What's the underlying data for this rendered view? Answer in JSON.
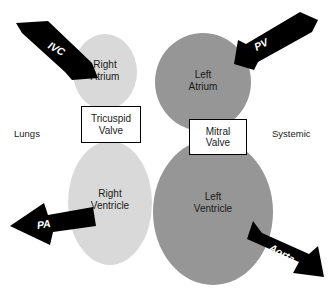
{
  "diagram": {
    "background_color": "#ffffff",
    "colors": {
      "right_side_fill": "#d9d9d9",
      "left_side_fill": "#969696",
      "arrow_fill": "#000000",
      "valve_box_fill": "#ffffff",
      "valve_box_border": "#000000",
      "text_color": "#1a1a1a",
      "arrow_text_color": "#ffffff"
    },
    "chambers": [
      {
        "id": "right-atrium",
        "label": "Right\nAtrium",
        "fill": "#d9d9d9",
        "cx": 105,
        "cy": 72,
        "rx": 32,
        "ry": 38,
        "label_x": 78,
        "label_y": 59,
        "label_w": 54
      },
      {
        "id": "left-atrium",
        "label": "Left\nAtrium",
        "fill": "#969696",
        "cx": 203,
        "cy": 82,
        "rx": 48,
        "ry": 49,
        "label_x": 176,
        "label_y": 69,
        "label_w": 54
      },
      {
        "id": "right-ventricle",
        "label": "Right\nVentricle",
        "fill": "#d9d9d9",
        "cx": 110,
        "cy": 203,
        "rx": 42,
        "ry": 62,
        "label_x": 80,
        "label_y": 188,
        "label_w": 60
      },
      {
        "id": "left-ventricle",
        "label": "Left\nVentricle",
        "fill": "#969696",
        "cx": 213,
        "cy": 212,
        "rx": 60,
        "ry": 73,
        "label_x": 183,
        "label_y": 191,
        "label_w": 60
      }
    ],
    "valves": [
      {
        "id": "tricuspid-valve",
        "label": "Tricuspid\nValve",
        "x": 81,
        "y": 106,
        "w": 60,
        "h": 37
      },
      {
        "id": "mitral-valve",
        "label": "Mitral\nValve",
        "x": 189,
        "y": 119,
        "w": 58,
        "h": 36
      }
    ],
    "side_labels": [
      {
        "id": "lungs-label",
        "text": "Lungs",
        "x": 14,
        "y": 128
      },
      {
        "id": "systemic-label",
        "text": "Systemic",
        "x": 272,
        "y": 128
      }
    ],
    "vessel_arrows": [
      {
        "id": "ivc-arrow",
        "label": "IVC",
        "direction": "down-right",
        "points_to": "right-atrium",
        "label_x": 52,
        "label_y": 39,
        "label_rotate": 29,
        "shaft": "16,22 50,22 86,60 70,76",
        "head": "96,76 62,76 80,58",
        "polygon": "16,23 48,21 92,63 98,78 72,80 65,72 22,33"
      },
      {
        "id": "pv-arrow",
        "label": "PV",
        "direction": "down-left",
        "points_to": "left-atrium",
        "label_x": 252,
        "label_y": 42,
        "label_rotate": -27,
        "polygon": "318,20 300,12 246,44 238,40 234,64 254,70 258,62 312,32"
      },
      {
        "id": "pa-arrow",
        "label": "PA",
        "direction": "left",
        "points_from": "right-ventricle",
        "label_x": 36,
        "label_y": 219,
        "label_rotate": -8,
        "polygon": "93,207 48,215 44,203 10,226 50,245 53,232 96,226"
      },
      {
        "id": "aorta-arrow",
        "label": "Aorta",
        "direction": "down-right",
        "points_from": "left-ventricle",
        "label_x": 273,
        "label_y": 241,
        "label_rotate": 29,
        "polygon": "253,221 247,239 299,262 293,273 324,277 318,246 309,254 262,233"
      }
    ]
  }
}
